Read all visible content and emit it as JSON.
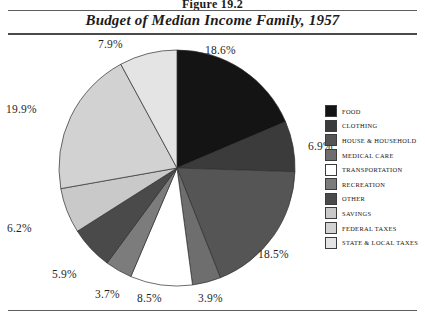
{
  "figure": {
    "label": "Figure 19.2"
  },
  "chart_title": "Budget of Median Income Family, 1957",
  "chart_data": {
    "type": "pie",
    "title": "Budget of Median Income Family, 1957",
    "xlabel": "",
    "ylabel": "",
    "legend_position": "right",
    "grid": false,
    "start_angle_deg": 0,
    "direction": "clockwise",
    "categories": [
      "FOOD",
      "CLOTHING",
      "HOUSE & HOUSEHOLD",
      "MEDICAL CARE",
      "TRANSPORTATION",
      "RECREATION",
      "OTHER",
      "SAVINGS",
      "FEDERAL TAXES",
      "STATE & LOCAL TAXES"
    ],
    "values": [
      18.6,
      6.9,
      18.5,
      3.9,
      8.5,
      3.7,
      5.9,
      6.2,
      19.9,
      7.9
    ],
    "data_labels": [
      "18.6%",
      "6.9%",
      "18.5%",
      "3.9%",
      "8.5%",
      "3.7%",
      "5.9%",
      "6.2%",
      "19.9%",
      "7.9%"
    ],
    "colors": [
      "#141414",
      "#3b3b3b",
      "#555555",
      "#6e6e6e",
      "#ffffff",
      "#7c7c7c",
      "#4a4a4a",
      "#c9c9c9",
      "#d2d2d2",
      "#e4e4e4"
    ]
  },
  "legend": {
    "items": [
      {
        "label": "FOOD",
        "color": "#141414"
      },
      {
        "label": "CLOTHING",
        "color": "#3b3b3b"
      },
      {
        "label": "HOUSE & HOUSEHOLD",
        "color": "#555555"
      },
      {
        "label": "MEDICAL CARE",
        "color": "#6e6e6e"
      },
      {
        "label": "TRANSPORTATION",
        "color": "#ffffff"
      },
      {
        "label": "RECREATION",
        "color": "#7c7c7c"
      },
      {
        "label": "OTHER",
        "color": "#4a4a4a"
      },
      {
        "label": "SAVINGS",
        "color": "#c9c9c9"
      },
      {
        "label": "FEDERAL TAXES",
        "color": "#d2d2d2"
      },
      {
        "label": "STATE & LOCAL TAXES",
        "color": "#e4e4e4"
      }
    ]
  },
  "pct_labels": [
    {
      "text": "18.6%",
      "left": 205,
      "top": 44
    },
    {
      "text": "6.9%",
      "left": 308,
      "top": 140
    },
    {
      "text": "18.5%",
      "left": 258,
      "top": 248
    },
    {
      "text": "3.9%",
      "left": 198,
      "top": 292
    },
    {
      "text": "8.5%",
      "left": 137,
      "top": 292
    },
    {
      "text": "3.7%",
      "left": 95,
      "top": 288
    },
    {
      "text": "5.9%",
      "left": 52,
      "top": 268
    },
    {
      "text": "6.2%",
      "left": 7,
      "top": 222
    },
    {
      "text": "19.9%",
      "left": 6,
      "top": 103
    },
    {
      "text": "7.9%",
      "left": 98,
      "top": 38
    }
  ]
}
